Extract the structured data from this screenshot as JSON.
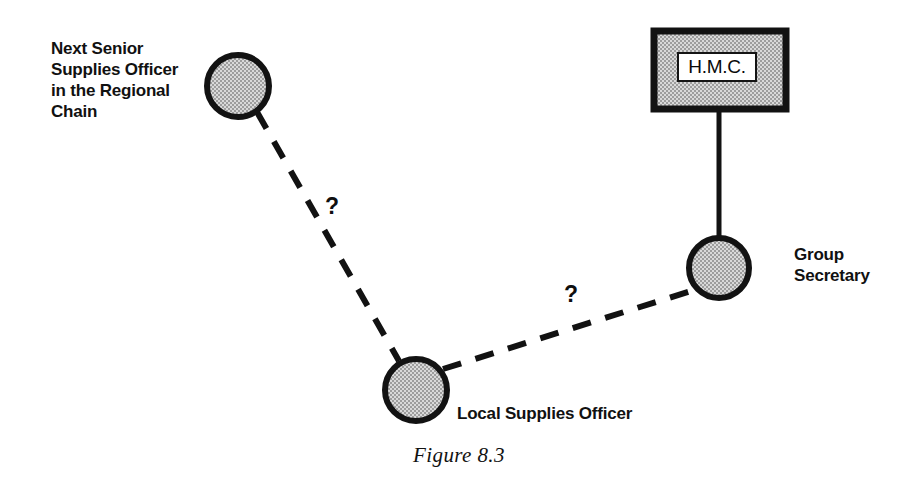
{
  "figure": {
    "caption": "Figure 8.3",
    "background_color": "#ffffff",
    "ink_color": "#121212",
    "node_fill_color": "#b9b9b9"
  },
  "nodes": {
    "next_senior_supplies_officer": {
      "label": "Next Senior\nSupplies Officer\nin the Regional\nChain",
      "shape": "circle",
      "cx": 238,
      "cy": 86,
      "r": 31
    },
    "local_supplies_officer": {
      "label": "Local Supplies Officer",
      "shape": "circle",
      "cx": 416,
      "cy": 390,
      "r": 31
    },
    "group_secretary": {
      "label": "Group\nSecretary",
      "shape": "circle",
      "cx": 719,
      "cy": 268,
      "r": 30
    },
    "hmc": {
      "label": "H.M.C.",
      "shape": "rectangle",
      "x": 651,
      "y": 28,
      "width": 138,
      "height": 84
    }
  },
  "edges": {
    "hmc_to_group_secretary": {
      "style": "solid",
      "from": "hmc",
      "to": "group_secretary",
      "label": ""
    },
    "next_senior_to_local": {
      "style": "dashed",
      "from": "next_senior_supplies_officer",
      "to": "local_supplies_officer",
      "label": "?"
    },
    "local_to_group_secretary": {
      "style": "dashed",
      "from": "local_supplies_officer",
      "to": "group_secretary",
      "label": "?"
    }
  }
}
